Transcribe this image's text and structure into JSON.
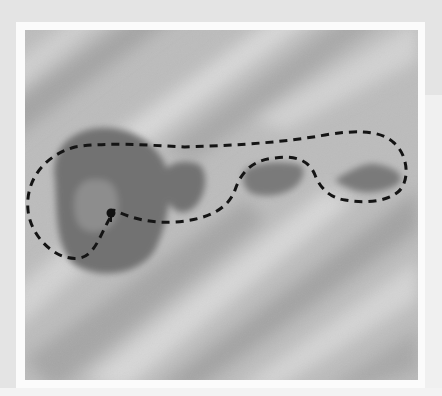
{
  "image": {
    "description": "Grayscale photograph of a surface with diagonal light/shadow bands; several dark blotches (one large round patch with a lighter center and two-to-three smaller irregular patches) enclosed by a dashed outline forming a looping path that starts at a dot in the large patch.",
    "colors": {
      "outer_background": "#e4e4e4",
      "frame": "#fbfbfb",
      "surface_light": "#c9c9c9",
      "surface_dark": "#9e9e9e",
      "blotch": "#707070",
      "blotch_center": "#8c8c8c",
      "dashed_outline": "#111111"
    },
    "features": [
      {
        "name": "large-round-patch",
        "shade": "dark"
      },
      {
        "name": "patch-center",
        "shade": "medium"
      },
      {
        "name": "small-patch-1",
        "shade": "dark"
      },
      {
        "name": "small-patch-2",
        "shade": "dark"
      },
      {
        "name": "small-patch-3",
        "shade": "dark"
      },
      {
        "name": "start-dot",
        "shade": "black"
      },
      {
        "name": "dashed-outline",
        "style": "dashed"
      }
    ]
  }
}
